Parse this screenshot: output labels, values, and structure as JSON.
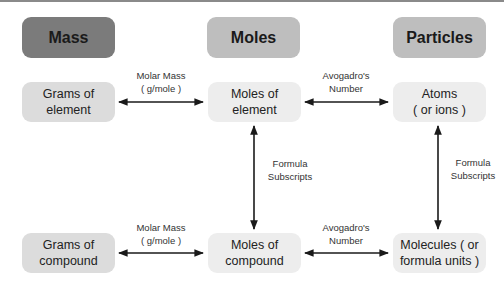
{
  "headers": {
    "mass": "Mass",
    "moles": "Moles",
    "particles": "Particles"
  },
  "nodes": {
    "grams_element": "Grams of\nelement",
    "moles_element": "Moles of\nelement",
    "atoms": "Atoms\n( or ions )",
    "grams_compound": "Grams of\ncompound",
    "moles_compound": "Moles of\ncompound",
    "molecules": "Molecules ( or\nformula units )"
  },
  "labels": {
    "molar_mass_top": "Molar Mass\n( g/mole )",
    "avogadro_top": "Avogadro's\nNumber",
    "subscripts_left": "Formula\nSubscripts",
    "subscripts_right": "Formula\nSubscripts",
    "molar_mass_bottom": "Molar Mass\n( g/mole )",
    "avogadro_bottom": "Avogadro's\nNumber"
  },
  "colors": {
    "header_dark": "#7b7b7b",
    "header_light": "#bebebe",
    "node_mid": "#dcdcdc",
    "node_pale": "#ededed",
    "arrow": "#1a1a1a"
  }
}
